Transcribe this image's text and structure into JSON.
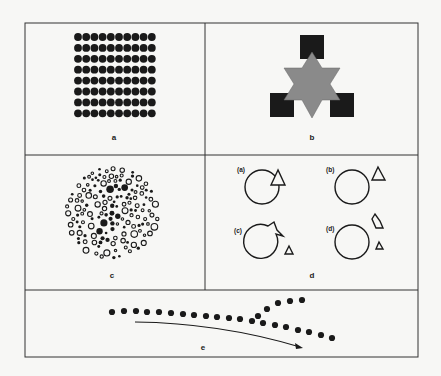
{
  "figure": {
    "panels": [
      {
        "id": "a",
        "label": "a",
        "description": "Uniform grid of filled black dots",
        "grid": {
          "columns": 10,
          "rows": 8
        }
      },
      {
        "id": "b",
        "label": "b",
        "description": "Gray six-pointed star overlapping three black squares"
      },
      {
        "id": "c",
        "label": "c",
        "description": "Circular cluster of open and filled circles of varying size (hidden figure)"
      },
      {
        "id": "d",
        "label": "d",
        "description": "Four sub-panels of a circle and a triangle",
        "subpanels": [
          {
            "label": "(a)",
            "description": "Triangle overlapping circle"
          },
          {
            "label": "(b)",
            "description": "Triangle separate from circle"
          },
          {
            "label": "(c)",
            "description": "Triangle merged into circle outline, small triangle beside"
          },
          {
            "label": "(d)",
            "description": "Circle with fragmented triangle pieces beside"
          }
        ]
      },
      {
        "id": "e",
        "label": "e",
        "description": "Row of dots that splits into two branches, with a curved arrow beneath"
      }
    ]
  },
  "colors": {
    "background": "#f7f7f5",
    "ink": "#1a1a1a",
    "star_gray": "#8a8a8a",
    "frame": "#333333"
  }
}
